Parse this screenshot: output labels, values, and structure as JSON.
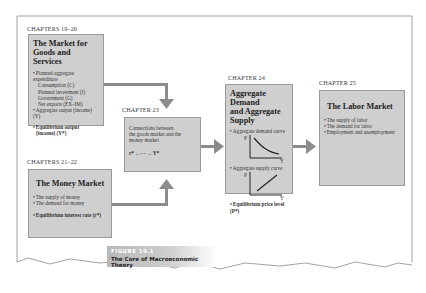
{
  "figure": {
    "tag": "FIGURE 19.1",
    "title": "The Core of Macroeconomic Theory"
  },
  "goods_market": {
    "chapter": "CHAPTERS 19–20",
    "title_line1": "The Market for",
    "title_line2": "Goods and Services",
    "items": [
      "Planned aggregate expenditure",
      "Consumption (C)",
      "Planned investment (I)",
      "Government (G)",
      "Net exports (EX–IM)",
      "Aggregate output (income) (Y)"
    ],
    "emphasis_line1": "Equilibrium output",
    "emphasis_line2": "(income) (Y*)"
  },
  "money_market": {
    "chapter": "CHAPTERS 21–22",
    "title": "The Money Market",
    "items": [
      "The supply of money",
      "The demand for money"
    ],
    "emphasis": "Equilibrium interest rate (r*)"
  },
  "connections": {
    "chapter": "CHAPTER 23",
    "text_line1": "Connections between",
    "text_line2": "the goods market and the",
    "text_line3": "money market",
    "relation": "r* ←- - → Y*"
  },
  "ad_as": {
    "chapter": "CHAPTER 24",
    "title_line1": "Aggregate Demand",
    "title_line2": "and Aggregate Supply",
    "demand_label": "Aggregate demand curve",
    "supply_label": "Aggregate supply curve",
    "axis_p": "P",
    "axis_y": "Y",
    "emphasis": "Equilibrium price level (P*)"
  },
  "labor_market": {
    "chapter": "CHAPTER 25",
    "title": "The Labor Market",
    "items": [
      "The supply of labor",
      "The demand for labor",
      "Employment and unemployment"
    ]
  },
  "colors": {
    "box_fill": "#cfcfcf",
    "box_border": "#9a9a9a",
    "arrow": "#8c8c8c",
    "caption_bg": "#bdbdbd"
  }
}
